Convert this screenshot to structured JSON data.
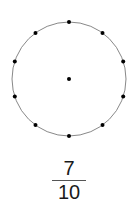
{
  "diagram": {
    "type": "circle-with-points",
    "center": [
      69,
      79
    ],
    "radius": 57,
    "points_on_circle": 10,
    "center_point": true,
    "point_color": "#000000",
    "circle_color": "#888888"
  },
  "fraction": {
    "numerator": "7",
    "denominator": "10"
  }
}
